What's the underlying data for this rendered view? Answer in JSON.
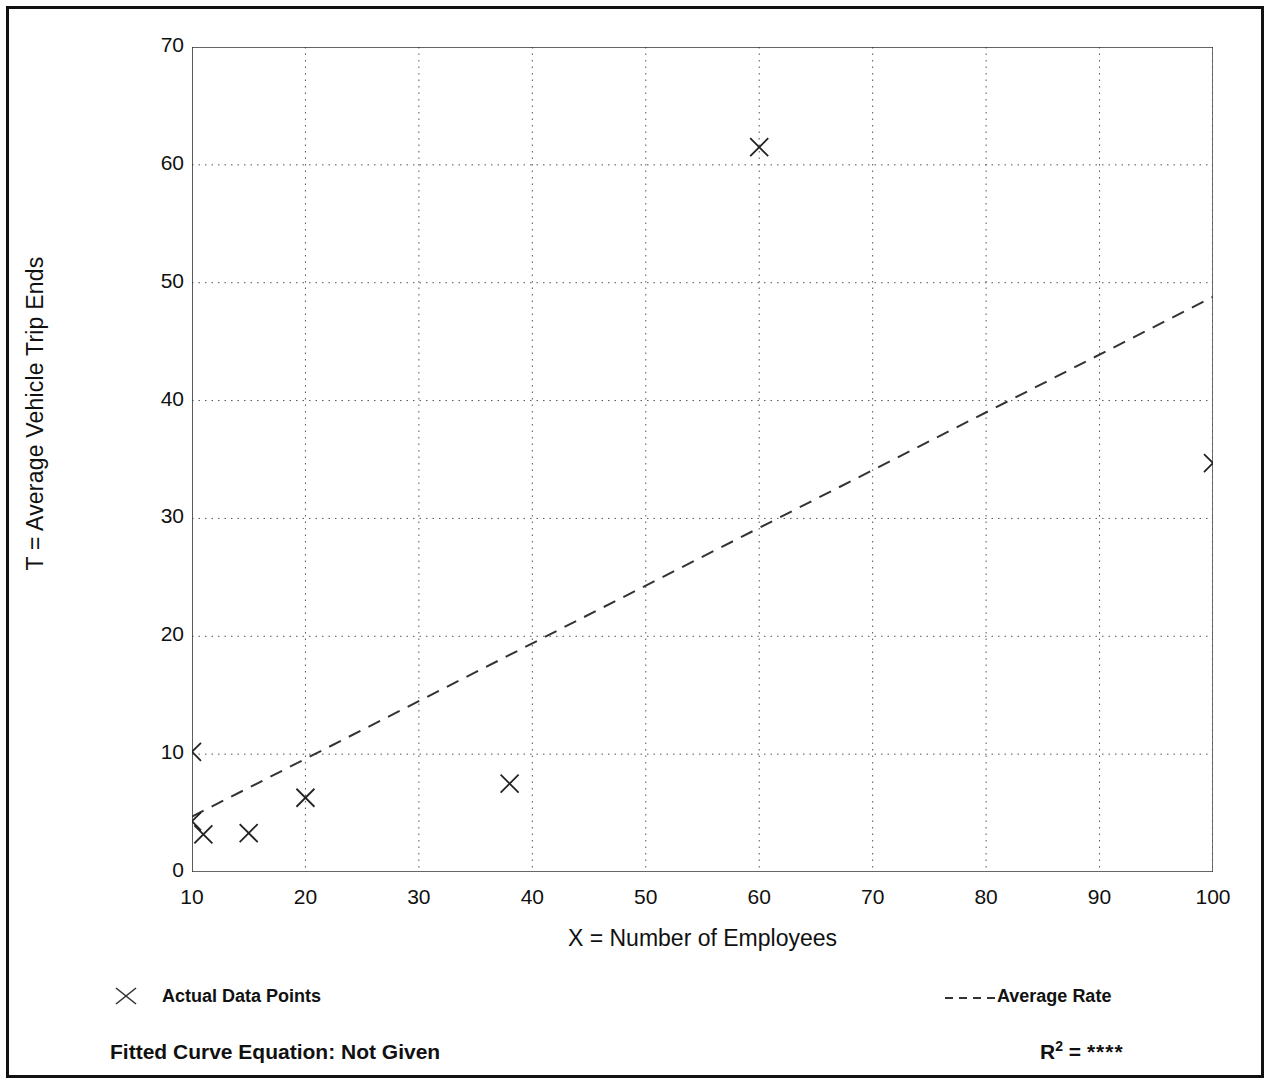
{
  "chart_data": {
    "type": "scatter",
    "title": "",
    "xlabel": "X = Number of Employees",
    "ylabel": "T = Average Vehicle Trip Ends",
    "xlim": [
      10,
      100
    ],
    "ylim": [
      0,
      70
    ],
    "x_ticks": [
      10,
      20,
      30,
      40,
      50,
      60,
      70,
      80,
      90,
      100
    ],
    "y_ticks": [
      0,
      10,
      20,
      30,
      40,
      50,
      60,
      70
    ],
    "x_minor_tick_step": 5,
    "y_minor_tick_step": 5,
    "grid": true,
    "grid_style": "dotted",
    "legend_position": "below-plot",
    "series": [
      {
        "name": "Actual Data Points",
        "type": "scatter",
        "marker": "x",
        "points": [
          {
            "x": 10,
            "y": 10.2
          },
          {
            "x": 10,
            "y": 4.3
          },
          {
            "x": 11,
            "y": 3.2
          },
          {
            "x": 15,
            "y": 3.3
          },
          {
            "x": 20,
            "y": 6.3
          },
          {
            "x": 38,
            "y": 7.5
          },
          {
            "x": 60,
            "y": 61.5
          },
          {
            "x": 100,
            "y": 34.7
          }
        ]
      },
      {
        "name": "Average Rate",
        "type": "line",
        "style": "dashed",
        "points": [
          {
            "x": 10,
            "y": 4.7
          },
          {
            "x": 100,
            "y": 48.8
          }
        ]
      }
    ],
    "annotations": {
      "fitted_curve_equation": "Fitted Curve Equation:  Not Given",
      "r_squared": "****"
    }
  },
  "axes": {
    "y_title": "T = Average Vehicle Trip Ends",
    "x_title": "X = Number of Employees",
    "x_tick_labels": [
      "10",
      "20",
      "30",
      "40",
      "50",
      "60",
      "70",
      "80",
      "90",
      "100"
    ],
    "y_tick_labels": [
      "0",
      "10",
      "20",
      "30",
      "40",
      "50",
      "60",
      "70"
    ]
  },
  "legend": {
    "actual_label": "Actual Data Points",
    "average_label": "Average Rate"
  },
  "footer": {
    "equation_text": "Fitted Curve Equation:  Not Given",
    "r_label": "R",
    "r_exponent": "2",
    "r_equals": " = ",
    "r_value": "****"
  },
  "colors": {
    "frame": "#111111",
    "axis": "#333333",
    "grid": "#555555",
    "marker": "#222222",
    "trend": "#333333",
    "background": "#ffffff"
  }
}
